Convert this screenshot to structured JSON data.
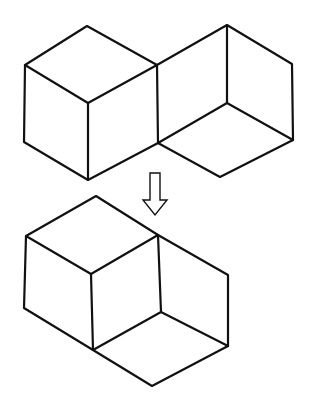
{
  "diagram": {
    "title": "",
    "background": "#ffffff",
    "stroke": "#111111",
    "stroke_width": 2.2,
    "figures": [
      {
        "name": "top-figure",
        "description": "Left cube (outer hexagon with three inner edges) joined to a right open-corner shape",
        "polylines": [
          [
            [
              25,
              65
            ],
            [
              87,
              26
            ],
            [
              157,
              65
            ],
            [
              88,
              103
            ],
            [
              25,
              65
            ]
          ],
          [
            [
              25,
              65
            ],
            [
              24,
              142
            ],
            [
              88,
              180
            ],
            [
              158,
              143
            ],
            [
              157,
              65
            ]
          ],
          [
            [
              88,
              103
            ],
            [
              88,
              180
            ]
          ],
          [
            [
              157,
              65
            ],
            [
              227,
              25
            ],
            [
              292,
              64
            ],
            [
              293,
              140
            ],
            [
              220,
              177
            ],
            [
              158,
              143
            ]
          ],
          [
            [
              227,
              25
            ],
            [
              227,
              103
            ]
          ],
          [
            [
              158,
              143
            ],
            [
              227,
              103
            ],
            [
              293,
              140
            ]
          ]
        ]
      },
      {
        "name": "transform-arrow",
        "description": "Hollow downward arrow",
        "polygon": [
          [
            150,
            173
          ],
          [
            160,
            173
          ],
          [
            160,
            200
          ],
          [
            167,
            200
          ],
          [
            155,
            215
          ],
          [
            143,
            200
          ],
          [
            150,
            200
          ]
        ]
      },
      {
        "name": "bottom-figure",
        "description": "Cube with an attached rhombic prism forming the rearranged shape",
        "polylines": [
          [
            [
              26,
              236
            ],
            [
              96,
              196
            ],
            [
              158,
              235
            ],
            [
              91,
              274
            ],
            [
              26,
              236
            ]
          ],
          [
            [
              26,
              236
            ],
            [
              24,
              308
            ],
            [
              93,
              350
            ],
            [
              161,
              312
            ],
            [
              158,
              235
            ]
          ],
          [
            [
              91,
              274
            ],
            [
              93,
              350
            ]
          ],
          [
            [
              158,
              235
            ],
            [
              228,
              275
            ],
            [
              228,
              346
            ],
            [
              152,
              386
            ],
            [
              93,
              350
            ]
          ],
          [
            [
              161,
              312
            ],
            [
              228,
              346
            ]
          ]
        ]
      }
    ]
  }
}
